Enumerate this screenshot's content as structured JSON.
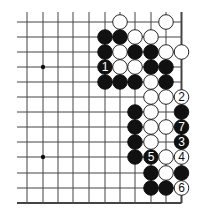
{
  "board": {
    "columns": 11,
    "rows": 13,
    "col_x": [
      27,
      43,
      58,
      73,
      89,
      105,
      120,
      135,
      151,
      166,
      181.5
    ],
    "row_y": [
      22,
      37,
      52,
      67,
      82,
      97,
      112,
      127,
      142,
      157,
      173,
      188,
      203
    ],
    "edges": {
      "right": true,
      "bottom": true,
      "top": false,
      "left": false
    },
    "hoshi": [
      {
        "c": 1,
        "r": 3
      },
      {
        "c": 1,
        "r": 9
      }
    ],
    "line_color": "#444444",
    "stone_radius": 7.3
  },
  "stones": [
    {
      "c": 6,
      "r": 0,
      "color": "white"
    },
    {
      "c": 9,
      "r": 0,
      "color": "white"
    },
    {
      "c": 5,
      "r": 1,
      "color": "black"
    },
    {
      "c": 6,
      "r": 1,
      "color": "black"
    },
    {
      "c": 7,
      "r": 1,
      "color": "white"
    },
    {
      "c": 8,
      "r": 1,
      "color": "white"
    },
    {
      "c": 5,
      "r": 2,
      "color": "black"
    },
    {
      "c": 6,
      "r": 2,
      "color": "white"
    },
    {
      "c": 7,
      "r": 2,
      "color": "black"
    },
    {
      "c": 8,
      "r": 2,
      "color": "black"
    },
    {
      "c": 9,
      "r": 2,
      "color": "white"
    },
    {
      "c": 10,
      "r": 2,
      "color": "white"
    },
    {
      "c": 5,
      "r": 3,
      "color": "black",
      "label": "1"
    },
    {
      "c": 6,
      "r": 3,
      "color": "white"
    },
    {
      "c": 7,
      "r": 3,
      "color": "white"
    },
    {
      "c": 8,
      "r": 3,
      "color": "black"
    },
    {
      "c": 9,
      "r": 3,
      "color": "black"
    },
    {
      "c": 5,
      "r": 4,
      "color": "black"
    },
    {
      "c": 6,
      "r": 4,
      "color": "black"
    },
    {
      "c": 7,
      "r": 4,
      "color": "black"
    },
    {
      "c": 8,
      "r": 4,
      "color": "white"
    },
    {
      "c": 9,
      "r": 4,
      "color": "black"
    },
    {
      "c": 8,
      "r": 5,
      "color": "white"
    },
    {
      "c": 9,
      "r": 5,
      "color": "white"
    },
    {
      "c": 10,
      "r": 5,
      "color": "white",
      "label": "2"
    },
    {
      "c": 7,
      "r": 6,
      "color": "black"
    },
    {
      "c": 8,
      "r": 6,
      "color": "white"
    },
    {
      "c": 10,
      "r": 6,
      "color": "black"
    },
    {
      "c": 7,
      "r": 7,
      "color": "black"
    },
    {
      "c": 8,
      "r": 7,
      "color": "white"
    },
    {
      "c": 9,
      "r": 7,
      "color": "white"
    },
    {
      "c": 10,
      "r": 7,
      "color": "black",
      "label": "7"
    },
    {
      "c": 7,
      "r": 8,
      "color": "black"
    },
    {
      "c": 8,
      "r": 8,
      "color": "white"
    },
    {
      "c": 10,
      "r": 8,
      "color": "black",
      "label": "3"
    },
    {
      "c": 7,
      "r": 9,
      "color": "black"
    },
    {
      "c": 8,
      "r": 9,
      "color": "black",
      "label": "5"
    },
    {
      "c": 9,
      "r": 9,
      "color": "white"
    },
    {
      "c": 10,
      "r": 9,
      "color": "white",
      "label": "4"
    },
    {
      "c": 8,
      "r": 10,
      "color": "black"
    },
    {
      "c": 9,
      "r": 10,
      "color": "white"
    },
    {
      "c": 10,
      "r": 10,
      "color": "black"
    },
    {
      "c": 8,
      "r": 11,
      "color": "black"
    },
    {
      "c": 9,
      "r": 11,
      "color": "black"
    },
    {
      "c": 10,
      "r": 11,
      "color": "white",
      "label": "6"
    }
  ]
}
